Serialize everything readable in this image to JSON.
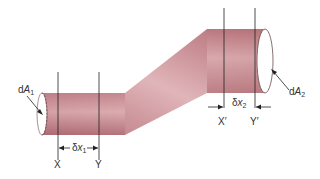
{
  "diagram": {
    "type": "pipe-flow-continuity",
    "colors": {
      "pipe_fill": "#c8868c",
      "pipe_highlight": "#e8c6c8",
      "pipe_shadow": "#a85e66",
      "outline": "#6a4a4c",
      "line": "#222222",
      "text": "#333333"
    },
    "labels": {
      "dA1": {
        "prefix": "d",
        "var": "A",
        "sub": "1"
      },
      "dA2": {
        "prefix": "d",
        "var": "A",
        "sub": "2"
      },
      "dx1": {
        "prefix": "δ",
        "var": "x",
        "sub": "1"
      },
      "dx2": {
        "prefix": "δ",
        "var": "x",
        "sub": "2"
      },
      "X": "X",
      "Y": "Y",
      "Xp": "X′",
      "Yp": "Y′"
    }
  }
}
